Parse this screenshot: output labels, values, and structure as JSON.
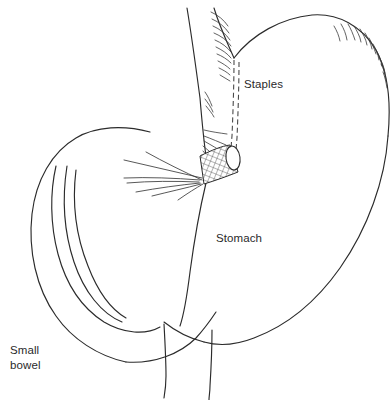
{
  "figure": {
    "background_color": "#ffffff",
    "line_color": "#2b2b2b",
    "width": 392,
    "height": 400
  },
  "labels": {
    "staples": "Staples",
    "stomach": "Stomach",
    "small_bowel": "Small\nbowel"
  },
  "parts": {
    "esophagus": "esophagus",
    "gastric_pouch": "gastric-pouch",
    "staple_line": "staple-line",
    "cut_end_mesh": "cut-end-crosshatch",
    "lumen": "lumen-opening",
    "fundus": "gastric-fundus",
    "greater_curvature": "greater-curvature",
    "duodenum": "duodenum",
    "small_bowel_loop": "small-bowel-loop",
    "mesenteric_vessels": "mesenteric-vessels"
  }
}
